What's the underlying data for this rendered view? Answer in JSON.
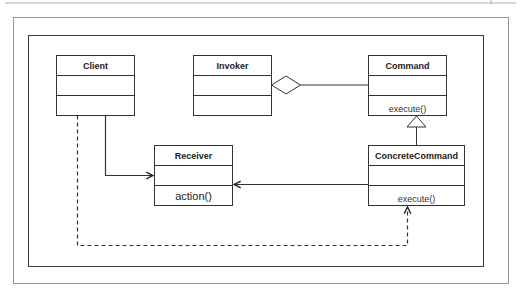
{
  "diagram": {
    "type": "UML class diagram",
    "pattern": "Command",
    "colors": {
      "stroke": "#3a3a3a",
      "frame": "#777777",
      "background": "#ffffff"
    },
    "classes": [
      {
        "id": "client",
        "name": "Client",
        "attributes": [],
        "operations": []
      },
      {
        "id": "invoker",
        "name": "Invoker",
        "attributes": [],
        "operations": []
      },
      {
        "id": "command",
        "name": "Command",
        "attributes": [],
        "operations": [
          "execute()"
        ]
      },
      {
        "id": "receiver",
        "name": "Receiver",
        "attributes": [],
        "operations": [
          "action()"
        ]
      },
      {
        "id": "concrete_command",
        "name": "ConcreteCommand",
        "attributes": [],
        "operations": [
          "execute()"
        ]
      }
    ],
    "relationships": [
      {
        "from": "Invoker",
        "to": "Command",
        "type": "aggregation"
      },
      {
        "from": "ConcreteCommand",
        "to": "Command",
        "type": "generalization"
      },
      {
        "from": "Client",
        "to": "Receiver",
        "type": "association"
      },
      {
        "from": "ConcreteCommand",
        "to": "Receiver",
        "type": "association"
      },
      {
        "from": "Client",
        "to": "ConcreteCommand",
        "type": "dependency"
      }
    ]
  }
}
